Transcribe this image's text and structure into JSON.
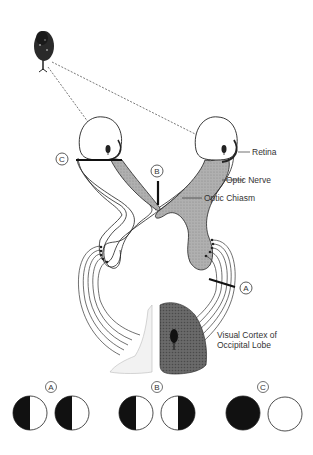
{
  "diagram": {
    "labels": {
      "retina": "Retina",
      "optic_nerve": "Optic Nerve",
      "optic_chiasm": "Optic Chiasm",
      "visual_cortex_line1": "Visual Cortex of",
      "visual_cortex_line2": "Occipital Lobe"
    },
    "lesion_markers": {
      "a": "A",
      "b": "B",
      "c": "C"
    },
    "visual_field_deficits": [
      {
        "marker": "A",
        "left_eye": "left half dark",
        "right_eye": "left half dark"
      },
      {
        "marker": "B",
        "left_eye": "left half dark",
        "right_eye": "right half dark"
      },
      {
        "marker": "C",
        "left_eye": "fully dark",
        "right_eye": "clear"
      }
    ],
    "colors": {
      "shaded_pathway": "#a8a8a8",
      "cortex_dark": "#6e6e6e",
      "ink": "#222222"
    }
  }
}
